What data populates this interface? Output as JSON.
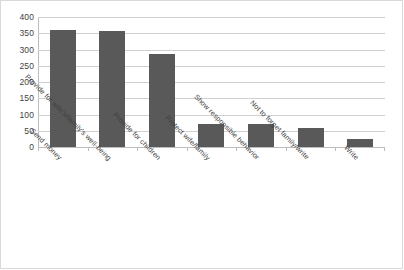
{
  "chart_data": {
    "type": "bar",
    "title": "",
    "subtitle": "",
    "xlabel": "",
    "ylabel": "",
    "ylim": [
      0,
      400
    ],
    "ytick_step": 50,
    "yticks": [
      0,
      50,
      100,
      150,
      200,
      250,
      300,
      350,
      400
    ],
    "ytick_labels": [
      "0",
      "50",
      "100",
      "150",
      "200",
      "250",
      "300",
      "350",
      "400"
    ],
    "grid": true,
    "grid_axis": "y",
    "legend": false,
    "legend_position": "none",
    "categories": [
      "Send money",
      "Provide for wife's/family's well-being",
      "Provide for children",
      "Protect wife/family",
      "Show responsible behavior",
      "Not to forget family/write",
      "Write"
    ],
    "values": [
      360,
      357,
      285,
      70,
      72,
      58,
      25
    ],
    "series": [
      {
        "name": "Responses",
        "values": [
          360,
          357,
          285,
          70,
          72,
          58,
          25
        ]
      }
    ],
    "bar_color": "#595959",
    "annotations": []
  },
  "style": {
    "background": "#ffffff",
    "grid_color": "#d0d0d0",
    "axis_color": "#bdbdbd",
    "frame_color": "#d9d9d9",
    "text_color": "#3f3f3f",
    "bar_color": "#595959"
  }
}
